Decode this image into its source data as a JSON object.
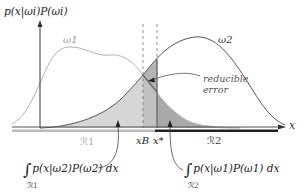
{
  "figure": {
    "y_axis_label": "p(x|ωi)P(ωi)",
    "x_axis_label": "x",
    "curves": [
      {
        "name": "ω1",
        "label": "ω1",
        "color": "#aaaaaa"
      },
      {
        "name": "ω2",
        "label": "ω2",
        "color": "#444444"
      }
    ],
    "thresholds": [
      {
        "name": "x_B",
        "label": "xB"
      },
      {
        "name": "x_star",
        "label": "x*"
      }
    ],
    "regions": [
      {
        "name": "R1",
        "label": "ℛ1",
        "bar_color": "#bbbbbb"
      },
      {
        "name": "R2",
        "label": "ℛ2",
        "bar_color": "#222222"
      }
    ],
    "annotations": {
      "reducible_error_line1": "reducible",
      "reducible_error_line2": "error",
      "integral_left": "p(x|ω2)P(ω2) dx",
      "integral_left_sub": "ℛ1",
      "integral_right": "p(x|ω1)P(ω1) dx",
      "integral_right_sub": "ℛ2",
      "integral_symbol": "∫"
    },
    "fills": {
      "left_error": "#d6d6d6",
      "reducible": "#bdbdbd",
      "right_error": "#a8a8a8"
    }
  }
}
